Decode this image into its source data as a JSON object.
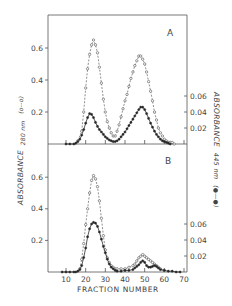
{
  "chart_data": [
    {
      "type": "line",
      "panel": "A",
      "xlabel": "FRACTION NUMBER",
      "ylabel_left": "ABSORBANCE 280 nm (o---o)",
      "ylabel_right": "ABSORBANCE 445 nm (●—●)",
      "ylim_left": [
        0,
        0.8
      ],
      "ylim_right": [
        0,
        0.08
      ],
      "left_ticks": [
        0.2,
        0.4,
        0.6
      ],
      "right_ticks": [
        0.02,
        0.04,
        0.06
      ],
      "series": [
        {
          "name": "Absorbance 280 nm",
          "style": "dashed, open circles",
          "axis": "left",
          "x": [
            16,
            18,
            19,
            20,
            21,
            22,
            23,
            24,
            25,
            26,
            27,
            28,
            29,
            30,
            31,
            32,
            33,
            34,
            35,
            36,
            37,
            38,
            39,
            40,
            41,
            42,
            43,
            44,
            45,
            46,
            47,
            48,
            49,
            50,
            51,
            52,
            53,
            54,
            55,
            56,
            57,
            58,
            59,
            60,
            61,
            62,
            63,
            64,
            65
          ],
          "y": [
            0.02,
            0.08,
            0.2,
            0.35,
            0.47,
            0.56,
            0.62,
            0.65,
            0.62,
            0.57,
            0.48,
            0.38,
            0.28,
            0.2,
            0.14,
            0.1,
            0.07,
            0.05,
            0.05,
            0.08,
            0.12,
            0.17,
            0.22,
            0.27,
            0.31,
            0.36,
            0.41,
            0.45,
            0.49,
            0.52,
            0.55,
            0.55,
            0.53,
            0.5,
            0.45,
            0.39,
            0.33,
            0.27,
            0.2,
            0.15,
            0.1,
            0.07,
            0.05,
            0.03,
            0.02,
            0.01,
            0.01,
            0.01,
            0.0
          ]
        },
        {
          "name": "Absorbance 445 nm",
          "style": "solid, filled circles",
          "axis": "right",
          "x": [
            10,
            12,
            14,
            15,
            16,
            17,
            18,
            19,
            20,
            21,
            22,
            23,
            24,
            25,
            26,
            27,
            28,
            29,
            30,
            31,
            32,
            33,
            34,
            35,
            36,
            37,
            38,
            39,
            40,
            41,
            42,
            43,
            44,
            45,
            46,
            47,
            48,
            49,
            50,
            51,
            52,
            53,
            54,
            55,
            56,
            57,
            58,
            59,
            60,
            61,
            62,
            63
          ],
          "y": [
            0.0,
            0.0,
            0.0,
            0.001,
            0.003,
            0.006,
            0.011,
            0.018,
            0.026,
            0.033,
            0.038,
            0.037,
            0.033,
            0.027,
            0.022,
            0.018,
            0.015,
            0.012,
            0.009,
            0.007,
            0.005,
            0.004,
            0.003,
            0.003,
            0.004,
            0.006,
            0.009,
            0.012,
            0.015,
            0.019,
            0.023,
            0.027,
            0.031,
            0.035,
            0.039,
            0.043,
            0.046,
            0.046,
            0.043,
            0.038,
            0.032,
            0.026,
            0.021,
            0.016,
            0.012,
            0.009,
            0.006,
            0.004,
            0.003,
            0.002,
            0.001,
            0.0
          ]
        }
      ]
    },
    {
      "type": "line",
      "panel": "B",
      "xlabel": "FRACTION NUMBER",
      "ylabel_left": "ABSORBANCE 280 nm (o---o)",
      "ylabel_right": "ABSORBANCE 445 nm (●—●)",
      "ylim_left": [
        0,
        0.8
      ],
      "ylim_right": [
        0,
        0.08
      ],
      "left_ticks": [
        0.2,
        0.4,
        0.6
      ],
      "right_ticks": [
        0.02,
        0.04,
        0.06
      ],
      "xticks": [
        10,
        20,
        30,
        40,
        50,
        60,
        70
      ],
      "series": [
        {
          "name": "Absorbance 280 nm",
          "style": "dashed, open circles",
          "axis": "left",
          "x": [
            17,
            18,
            19,
            20,
            21,
            22,
            23,
            24,
            25,
            26,
            27,
            28,
            29,
            30,
            31,
            32,
            33,
            34,
            35,
            36,
            38,
            40,
            42,
            44,
            45,
            46,
            47,
            48,
            49,
            50,
            51,
            52,
            53,
            54,
            55,
            56,
            57,
            58,
            60
          ],
          "y": [
            0.02,
            0.08,
            0.18,
            0.3,
            0.4,
            0.5,
            0.58,
            0.61,
            0.59,
            0.54,
            0.45,
            0.34,
            0.23,
            0.14,
            0.09,
            0.06,
            0.04,
            0.03,
            0.02,
            0.02,
            0.02,
            0.02,
            0.03,
            0.04,
            0.05,
            0.07,
            0.09,
            0.1,
            0.11,
            0.1,
            0.09,
            0.08,
            0.07,
            0.06,
            0.05,
            0.04,
            0.03,
            0.02,
            0.01
          ]
        },
        {
          "name": "Absorbance 445 nm",
          "style": "solid, filled circles",
          "axis": "right",
          "x": [
            8,
            10,
            12,
            14,
            15,
            16,
            17,
            18,
            19,
            20,
            21,
            22,
            23,
            24,
            25,
            26,
            27,
            28,
            29,
            30,
            31,
            32,
            33,
            34,
            35,
            36,
            38,
            40,
            42,
            44,
            45,
            46,
            47,
            48,
            49,
            50,
            51,
            52,
            53,
            54,
            55,
            56,
            57,
            58,
            60,
            62,
            64,
            66,
            68
          ],
          "y": [
            0.0,
            0.0,
            0.0,
            0.0,
            0.0,
            0.001,
            0.003,
            0.008,
            0.018,
            0.03,
            0.044,
            0.054,
            0.06,
            0.062,
            0.061,
            0.057,
            0.05,
            0.041,
            0.032,
            0.024,
            0.016,
            0.01,
            0.006,
            0.004,
            0.002,
            0.001,
            0.001,
            0.002,
            0.002,
            0.003,
            0.005,
            0.007,
            0.009,
            0.012,
            0.014,
            0.012,
            0.008,
            0.006,
            0.006,
            0.007,
            0.008,
            0.007,
            0.005,
            0.003,
            0.002,
            0.001,
            0.001,
            0.0,
            0.0
          ]
        }
      ]
    }
  ],
  "labels": {
    "panel_a": "A",
    "panel_b": "B",
    "x_title": "FRACTION NUMBER",
    "y_left_title": "ABSORBANCE",
    "y_left_sub": "280 nm",
    "y_left_legend": "(o--o)",
    "y_right_title": "ABSORBANCE",
    "y_right_sub": "445 nm",
    "y_right_legend": "(●—●)",
    "left_tick_labels": [
      "0.2",
      "0.4",
      "0.6"
    ],
    "right_tick_labels": [
      "0.02",
      "0.04",
      "0.06"
    ],
    "x_tick_labels": [
      "10",
      "20",
      "30",
      "40",
      "50",
      "60",
      "70"
    ]
  }
}
